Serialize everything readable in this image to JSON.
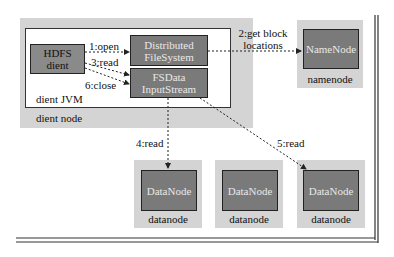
{
  "diagram": {
    "type": "HDFS read data flow",
    "client_node": {
      "label": "dient node",
      "jvm_label": "dient JVM",
      "hdfs_client": {
        "line1": "HDFS",
        "line2": "dient"
      },
      "distributed_fs": {
        "line1": "Distributed",
        "line2": "FileSystem"
      },
      "fsdata_stream": {
        "line1": "FSData",
        "line2": "InputStream"
      }
    },
    "namenode": {
      "box_label": "NameNode",
      "caption": "namenode"
    },
    "datanodes": [
      {
        "box_label": "DataNode",
        "caption": "datanode"
      },
      {
        "box_label": "DataNode",
        "caption": "datanode"
      },
      {
        "box_label": "DataNode",
        "caption": "datanode"
      }
    ],
    "edges": [
      {
        "label": "1:open",
        "from": "HDFS dient",
        "to": "DistributedFileSystem"
      },
      {
        "label": "2:get block",
        "label2": "locations",
        "from": "DistributedFileSystem",
        "to": "NameNode"
      },
      {
        "label": "3:read",
        "from": "HDFS dient",
        "to": "FSDataInputStream"
      },
      {
        "label": "4:read",
        "from": "FSDataInputStream",
        "to": "DataNode 1"
      },
      {
        "label": "5:read",
        "from": "FSDataInputStream",
        "to": "DataNode 3"
      },
      {
        "label": "6:close",
        "from": "HDFS dient",
        "to": "FSDataInputStream"
      }
    ],
    "colors": {
      "area_gray": "#d4d4d4",
      "box_dark": "#7a7a7a",
      "box_border": "#222222",
      "box_text": "#e8e8e8"
    }
  }
}
